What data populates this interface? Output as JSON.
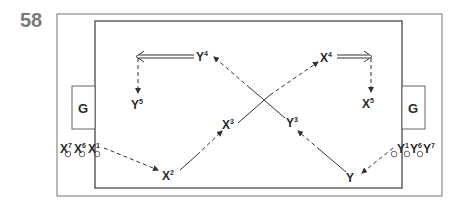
{
  "figure": {
    "number": "58",
    "goal_label": "G"
  },
  "players": {
    "team_x": [
      {
        "name": "X",
        "index": "1"
      },
      {
        "name": "X",
        "index": "2"
      },
      {
        "name": "X",
        "index": "3"
      },
      {
        "name": "X",
        "index": "4"
      },
      {
        "name": "X",
        "index": "5"
      },
      {
        "name": "X",
        "index": "6"
      },
      {
        "name": "X",
        "index": "7"
      }
    ],
    "team_y": [
      {
        "name": "Y",
        "index": "1"
      },
      {
        "name": "Y",
        "index": "3"
      },
      {
        "name": "Y",
        "index": "4"
      },
      {
        "name": "Y",
        "index": "5"
      },
      {
        "name": "Y",
        "index": "6"
      },
      {
        "name": "Y",
        "index": "7"
      }
    ]
  },
  "colors": {
    "frame": "#8a8a8a",
    "field": "#555555",
    "text": "#2a2a2a",
    "figure_number": "#7a7a7a"
  }
}
